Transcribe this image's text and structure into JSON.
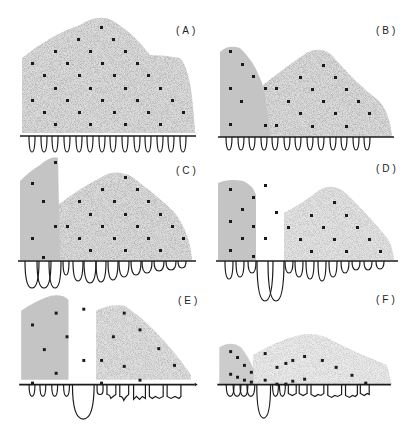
{
  "figure": {
    "colors": {
      "ink": "#1a1a1a",
      "stipple_dark": "#b8b8b8",
      "stipple_light": "#d6d6d6",
      "background": "#ffffff"
    },
    "panels": [
      {
        "id": "A",
        "label": "(A)"
      },
      {
        "id": "B",
        "label": "(B)"
      },
      {
        "id": "C",
        "label": "(C)"
      },
      {
        "id": "D",
        "label": "(D)"
      },
      {
        "id": "E",
        "label": "(E)"
      },
      {
        "id": "F",
        "label": "(F)"
      }
    ]
  }
}
